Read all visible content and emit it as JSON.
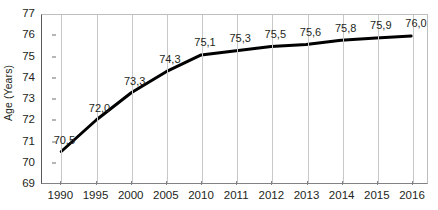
{
  "chart_data": {
    "type": "line",
    "title": "",
    "subtitle": "",
    "xlabel": "",
    "ylabel": "Age (Years)",
    "categories": [
      "1990",
      "1995",
      "2000",
      "2005",
      "2010",
      "2011",
      "2012",
      "2013",
      "2014",
      "2015",
      "2016"
    ],
    "values": [
      70.5,
      72.0,
      73.3,
      74.3,
      75.1,
      75.3,
      75.5,
      75.6,
      75.8,
      75.9,
      76.0
    ],
    "point_labels": [
      "70,5",
      "72,0",
      "73,3",
      "74,3",
      "75,1",
      "75,3",
      "75,5",
      "75,6",
      "75,8",
      "75,9",
      "76,0"
    ],
    "ylim": [
      69,
      77
    ],
    "y_ticks": [
      69,
      70,
      71,
      72,
      73,
      74,
      75,
      76,
      77
    ],
    "y_tick_labels": [
      "69",
      "70",
      "71",
      "72",
      "73",
      "74",
      "75",
      "76",
      "77"
    ],
    "grid": "vertical",
    "legend": "none",
    "series_name": "Life expectancy",
    "colors": {
      "line": "#000000",
      "gridline": "#c7c8ca",
      "axis": "#58595b",
      "text": "#231f20",
      "background": "#ffffff"
    }
  }
}
